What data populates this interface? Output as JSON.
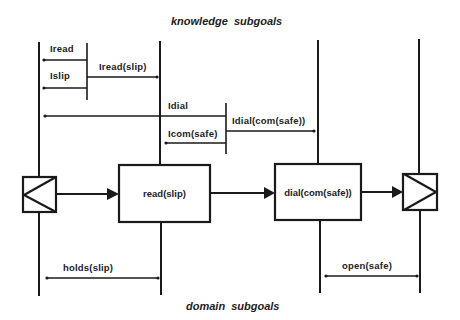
{
  "titles": {
    "top": "knowledge  subgoals",
    "bottom": "domain  subgoals"
  },
  "knowledge_labels": {
    "iread": "Iread",
    "islip": "Islip",
    "iread_slip": "Iread(slip)",
    "idial": "Idial",
    "icom_safe": "Icom(safe)",
    "idial_com_safe": "Idial(com(safe))"
  },
  "process_boxes": {
    "read": "read(slip)",
    "dial": "dial(com(safe))"
  },
  "domain_labels": {
    "holds_slip": "holds(slip)",
    "open_safe": "open(safe)"
  },
  "colors": {
    "line": "#1a1a1a",
    "background": "#ffffff"
  }
}
